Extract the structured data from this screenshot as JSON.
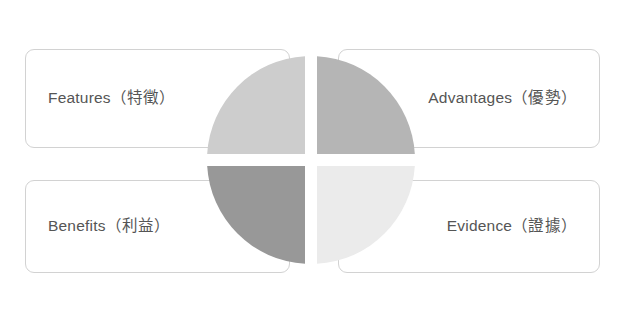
{
  "diagram": {
    "background_color": "#ffffff",
    "text_color": "#555555",
    "card_border_color": "#d2d2d2",
    "cards": [
      {
        "key": "features",
        "label": "Features（特徵）",
        "position": "top-left"
      },
      {
        "key": "advantages",
        "label": "Advantages（優勢）",
        "position": "top-right"
      },
      {
        "key": "benefits",
        "label": "Benefits（利益）",
        "position": "bottom-left"
      },
      {
        "key": "evidence",
        "label": "Evidence（證據）",
        "position": "bottom-right"
      }
    ],
    "circle": {
      "center_x": 104,
      "center_y": 104,
      "radius": 104,
      "gap": 12,
      "quadrants": [
        {
          "key": "top-left",
          "color": "#cdcdcd"
        },
        {
          "key": "top-right",
          "color": "#b5b5b5"
        },
        {
          "key": "bottom-left",
          "color": "#989898"
        },
        {
          "key": "bottom-right",
          "color": "#ebebeb"
        }
      ]
    }
  }
}
